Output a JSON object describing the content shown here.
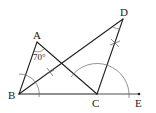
{
  "diagram": {
    "type": "geometry-construction",
    "points": {
      "A": {
        "label": "A",
        "x": 37,
        "y": 42
      },
      "B": {
        "label": "B",
        "x": 19,
        "y": 94
      },
      "C": {
        "label": "C",
        "x": 97,
        "y": 94
      },
      "D": {
        "label": "D",
        "x": 123,
        "y": 19
      },
      "E": {
        "label": "E",
        "x": 139,
        "y": 94
      }
    },
    "segments": [
      [
        "A",
        "B"
      ],
      [
        "A",
        "C"
      ],
      [
        "B",
        "C"
      ],
      [
        "C",
        "E"
      ],
      [
        "B",
        "D"
      ],
      [
        "C",
        "D"
      ]
    ],
    "angle_label": "70°",
    "colors": {
      "stroke": "#222222",
      "arc": "#555555",
      "background": "#ffffff"
    }
  }
}
